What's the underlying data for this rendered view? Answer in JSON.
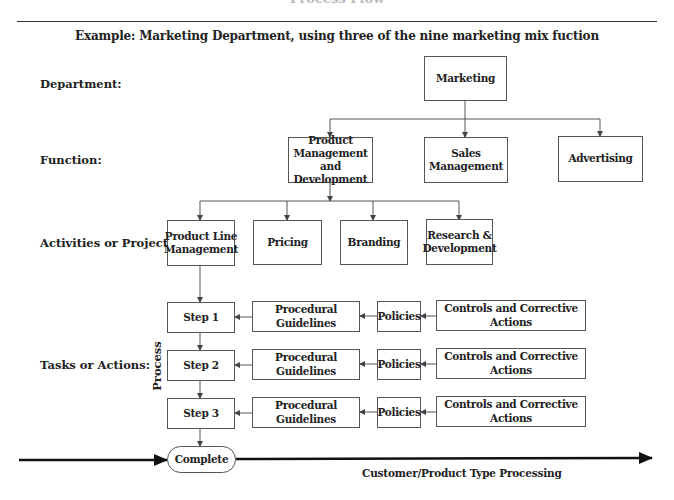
{
  "header": {
    "title": "Process Flow",
    "subtitle": "Example: Marketing Department, using three of the nine marketing mix fuction"
  },
  "row_labels": {
    "department": "Department:",
    "function": "Function:",
    "activities": "Activities or Projects:",
    "tasks": "Tasks or Actions:"
  },
  "department": {
    "label": "Marketing"
  },
  "functions": [
    {
      "label": "Product Management and Development"
    },
    {
      "label": "Sales Management"
    },
    {
      "label": "Advertising"
    }
  ],
  "activities": [
    {
      "label": "Product Line Management"
    },
    {
      "label": "Pricing"
    },
    {
      "label": "Branding"
    },
    {
      "label": "Research & Development"
    }
  ],
  "process_label": "Process",
  "steps": [
    {
      "step": "Step 1",
      "guidelines": "Procedural Guidelines",
      "policies": "Policies",
      "controls": "Controls and Corrective Actions"
    },
    {
      "step": "Step 2",
      "guidelines": "Procedural Guidelines",
      "policies": "Policies",
      "controls": "Controls and Corrective Actions"
    },
    {
      "step": "Step 3",
      "guidelines": "Procedural Guidelines",
      "policies": "Policies",
      "controls": "Controls and Corrective Actions"
    }
  ],
  "terminal": {
    "label": "Complete"
  },
  "axis": {
    "label": "Customer/Product Type Processing"
  },
  "colors": {
    "line": "#555555",
    "text": "#222222",
    "axis": "#111111"
  }
}
